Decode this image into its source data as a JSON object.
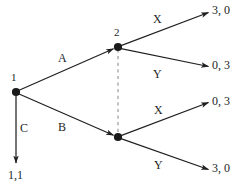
{
  "figure": {
    "type": "extensive-form-game-tree",
    "background_color": "#ffffff",
    "line_color": "#221f1f",
    "dashed_line_color": "#b5b5b5"
  },
  "nodes": [
    {
      "id": "root",
      "label": "1",
      "player": "1",
      "x": 16,
      "y": 92
    },
    {
      "id": "p2-top",
      "label": "2",
      "player": "2",
      "x": 118,
      "y": 47
    },
    {
      "id": "p2-bottom",
      "label": "",
      "player": "2",
      "x": 118,
      "y": 137
    }
  ],
  "information_set": {
    "style": "dashed",
    "from_node": "p2-top",
    "to_node": "p2-bottom"
  },
  "actions": {
    "root": [
      {
        "label": "A",
        "to": "p2-top"
      },
      {
        "label": "B",
        "to": "p2-bottom"
      },
      {
        "label": "C",
        "to": "terminal-C"
      }
    ],
    "p2_top": [
      {
        "label": "X",
        "to": "terminal-AX"
      },
      {
        "label": "Y",
        "to": "terminal-AY"
      }
    ],
    "p2_bottom": [
      {
        "label": "X",
        "to": "terminal-BX"
      },
      {
        "label": "Y",
        "to": "terminal-BY"
      }
    ]
  },
  "terminals": [
    {
      "id": "terminal-AX",
      "payoff": "3, 0"
    },
    {
      "id": "terminal-AY",
      "payoff": "0, 3"
    },
    {
      "id": "terminal-BX",
      "payoff": "0, 3"
    },
    {
      "id": "terminal-BY",
      "payoff": "3, 0"
    },
    {
      "id": "terminal-C",
      "payoff": "1,1"
    }
  ]
}
